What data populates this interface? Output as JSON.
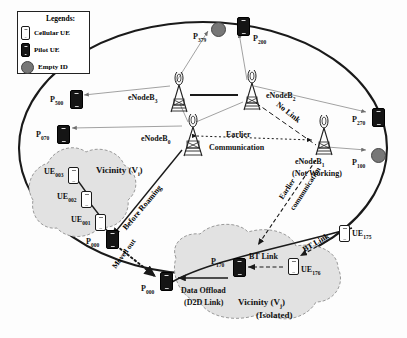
{
  "figure": {
    "type": "network-topology-diagram"
  },
  "legend": {
    "title": "Legends:",
    "items": [
      {
        "label": "Cellular UE",
        "glyph": "cellular-ue-phone",
        "color": "#ffffff"
      },
      {
        "label": "Pilot UE",
        "glyph": "pilot-ue-phone",
        "color": "#151515"
      },
      {
        "label": "Empty ID",
        "glyph": "empty-id-circle",
        "color": "#777777"
      }
    ]
  },
  "nodes": [
    {
      "id": "P379",
      "label": "P",
      "sub": "379",
      "kind": "empty-id",
      "x": 211,
      "y": 22
    },
    {
      "id": "P200",
      "label": "P",
      "sub": "200",
      "kind": "pilot-ue",
      "x": 237,
      "y": 17
    },
    {
      "id": "P500",
      "label": "P",
      "sub": "500",
      "kind": "pilot-ue",
      "x": 70,
      "y": 90
    },
    {
      "id": "P070",
      "label": "P",
      "sub": "070",
      "kind": "pilot-ue",
      "x": 57,
      "y": 125
    },
    {
      "id": "P270",
      "label": "P",
      "sub": "270",
      "kind": "pilot-ue",
      "x": 372,
      "y": 108
    },
    {
      "id": "P100",
      "label": "P",
      "sub": "100",
      "kind": "empty-id",
      "x": 371,
      "y": 148
    },
    {
      "id": "UE003",
      "label": "UE",
      "sub": "003",
      "kind": "cellular-ue",
      "x": 62,
      "y": 168
    },
    {
      "id": "UE002",
      "label": "UE",
      "sub": "002",
      "kind": "cellular-ue",
      "x": 74,
      "y": 193
    },
    {
      "id": "UE001",
      "label": "UE",
      "sub": "001",
      "kind": "cellular-ue",
      "x": 88,
      "y": 216
    },
    {
      "id": "P000a",
      "label": "P",
      "sub": "000",
      "kind": "pilot-ue",
      "x": 104,
      "y": 234
    },
    {
      "id": "P000b",
      "label": "P",
      "sub": "000",
      "kind": "pilot-ue",
      "x": 160,
      "y": 275
    },
    {
      "id": "P170",
      "label": "P",
      "sub": "170",
      "kind": "pilot-ue",
      "x": 233,
      "y": 262
    },
    {
      "id": "UE176",
      "label": "UE",
      "sub": "176",
      "kind": "cellular-ue",
      "x": 288,
      "y": 260
    },
    {
      "id": "UE175",
      "label": "UE",
      "sub": "175",
      "kind": "cellular-ue",
      "x": 339,
      "y": 227
    }
  ],
  "basestations": [
    {
      "id": "eNodeB3",
      "label": "eNodeB",
      "sub": "3",
      "x": 173,
      "y": 90,
      "status": ""
    },
    {
      "id": "eNodeB2",
      "label": "eNodeB",
      "sub": "2",
      "x": 246,
      "y": 88,
      "status": ""
    },
    {
      "id": "eNodeB0",
      "label": "eNodeB",
      "sub": "0",
      "x": 188,
      "y": 133,
      "status": ""
    },
    {
      "id": "eNodeB1",
      "label": "eNodeB",
      "sub": "1",
      "x": 321,
      "y": 150,
      "status": "(Not Working)"
    }
  ],
  "annotations": {
    "no_link": "No Link",
    "earlier_communication": "Earlier\nCommunication",
    "earlier_communication_line1": "Earlier",
    "earlier_communication_line2": "Communication",
    "earlier_communication_rot": "Earlier\ncommunication",
    "earlier_comm_rot_l1": "Earlier",
    "earlier_comm_rot_l2": "communication",
    "before_roaming": "Before Roaming",
    "moved_out": "Moved out",
    "bt_link_1": "BT Link",
    "bt_link_2": "BT Link",
    "data_offload_l1": "Data Offload",
    "data_offload_l2": "(D2D Link)",
    "not_working": "(Not Working)"
  },
  "vicinities": [
    {
      "id": "Vi",
      "line1": "Vicinity (V",
      "sub": "i",
      "close": ")",
      "line2": "",
      "x": 96,
      "y": 167
    },
    {
      "id": "Vj",
      "line1": "Vicinity (V",
      "sub": "j",
      "close": ")",
      "line2": "(Isolated)",
      "x": 252,
      "y": 300
    }
  ],
  "colors": {
    "outline": "#1a1a1a",
    "cloud_fill": "#e2e2e2",
    "cloud_stroke": "#9a9a9a",
    "pilot_fill": "#151515",
    "empty_fill": "#777777",
    "link_thin": "#8a8a8a"
  }
}
